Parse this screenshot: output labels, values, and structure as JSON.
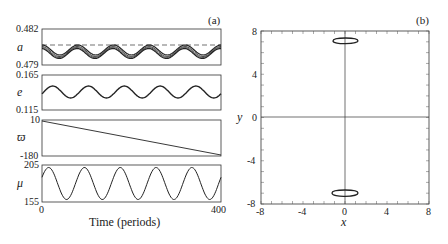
{
  "chart_data": [
    {
      "panel_label": "(a)",
      "type": "line",
      "xlabel": "Time (periods)",
      "xlim": [
        0,
        400
      ],
      "x_ticks": [
        "0",
        "400"
      ],
      "subplots": [
        {
          "ylabel": "a",
          "ylim": [
            0.479,
            0.482
          ],
          "y_ticks": [
            "0.482",
            "0.479"
          ],
          "description": "oscillating band of several curves, ~5 periods, with dashed reference line near 0.4812",
          "dashed_ref": 0.4812,
          "mean": 0.4807,
          "amplitude": 0.0004,
          "periods": 5
        },
        {
          "ylabel": "e",
          "ylim": [
            0.115,
            0.165
          ],
          "y_ticks": [
            "0.165",
            "0.115"
          ],
          "mean": 0.14,
          "amplitude": 0.007,
          "periods": 5
        },
        {
          "ylabel": "ϖ",
          "ylim": [
            -180,
            10
          ],
          "y_ticks": [
            "10",
            "-180"
          ],
          "description": "linear decrease",
          "x": [
            0,
            400
          ],
          "values": [
            10,
            -180
          ]
        },
        {
          "ylabel": "μ",
          "ylim": [
            155,
            205
          ],
          "y_ticks": [
            "205",
            "155"
          ],
          "mean": 180,
          "amplitude": 25,
          "periods": 5
        }
      ]
    },
    {
      "panel_label": "(b)",
      "type": "scatter",
      "xlabel": "x",
      "ylabel": "y",
      "xlim": [
        -8,
        8
      ],
      "ylim": [
        -8,
        8
      ],
      "x_ticks": [
        "-8",
        "-4",
        "0",
        "4",
        "8"
      ],
      "y_ticks": [
        "8",
        "4",
        "0",
        "-4",
        "-8"
      ],
      "description": "two closed loops near (0, 7) and (0, -7) with axes through origin",
      "loops": [
        {
          "center": [
            0,
            7
          ],
          "x_range": [
            -1.2,
            1.4
          ],
          "y_range": [
            6.6,
            7.3
          ]
        },
        {
          "center": [
            0,
            -7
          ],
          "x_range": [
            -1.2,
            1.4
          ],
          "y_range": [
            -7.6,
            -6.8
          ]
        }
      ]
    }
  ],
  "labels": {
    "panel_a": "(a)",
    "panel_b": "(b)",
    "a_label": "a",
    "e_label": "e",
    "varpi_label": "ϖ",
    "mu_label": "μ",
    "a_top": "0.482",
    "a_bot": "0.479",
    "e_top": "0.165",
    "e_bot": "0.115",
    "w_top": "10",
    "w_bot": "-180",
    "mu_top": "205",
    "mu_bot": "155",
    "x0": "0",
    "x400": "400",
    "time_label": "Time (periods)",
    "b_y8": "8",
    "b_y4": "4",
    "b_y0": "0",
    "b_ym4": "-4",
    "b_ym8": "-8",
    "b_xm8": "-8",
    "b_xm4": "-4",
    "b_x0": "0",
    "b_x4": "4",
    "b_x8": "8",
    "b_xlabel": "x",
    "b_ylabel": "y"
  }
}
